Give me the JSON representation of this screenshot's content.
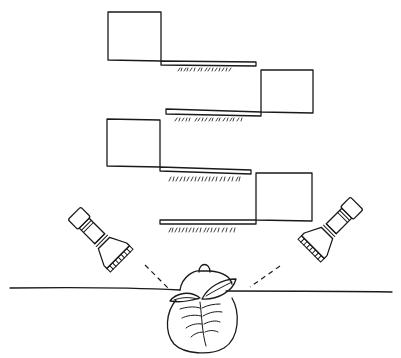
{
  "figure": {
    "colors": {
      "ink": "#1a1a1a",
      "background": "#ffffff"
    },
    "panels": [
      {
        "id": "panel-1",
        "side": "left"
      },
      {
        "id": "panel-2",
        "side": "right"
      },
      {
        "id": "panel-3",
        "side": "left"
      },
      {
        "id": "panel-4",
        "side": "right"
      }
    ],
    "lights": [
      {
        "id": "flashlight-left",
        "icon": "flashlight-icon"
      },
      {
        "id": "flashlight-right",
        "icon": "flashlight-icon"
      }
    ],
    "subject": {
      "id": "bud-object",
      "icon": "bud-icon"
    },
    "ground": {
      "id": "ground-line"
    }
  }
}
